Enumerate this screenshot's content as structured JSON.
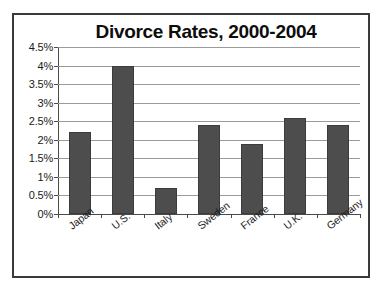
{
  "chart_data": {
    "type": "bar",
    "title": "Divorce Rates, 2000-2004",
    "xlabel": "",
    "ylabel": "",
    "categories": [
      "Japan",
      "U.S.",
      "Italy",
      "Sweden",
      "France",
      "U.K.",
      "Germany"
    ],
    "values": [
      2.2,
      4.0,
      0.7,
      2.4,
      1.9,
      2.6,
      2.4
    ],
    "value_suffix": "%",
    "ylim": [
      0,
      4.5
    ],
    "ytick_values": [
      0,
      0.5,
      1,
      1.5,
      2,
      2.5,
      3,
      3.5,
      4,
      4.5
    ],
    "ytick_labels": [
      "0%",
      "0.5%",
      "1%",
      "1.5%",
      "2%",
      "2.5%",
      "3%",
      "3.5%",
      "4%",
      "4.5%"
    ],
    "grid": true,
    "legend": false,
    "legend_position": "none",
    "bar_color": "#4d4d4d",
    "bar_border_color": "#3c3c3c",
    "gridline_color": "#9a9a9a",
    "axis_color": "#4a4a4a",
    "frame_color": "#3a3a3a",
    "background_color": "#ffffff",
    "text_color": "#1a1a1a",
    "category_label_rotation": -38
  }
}
